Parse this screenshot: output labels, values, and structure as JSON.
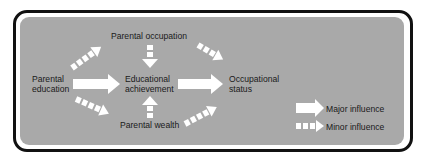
{
  "nodes": {
    "parental_education": {
      "line1": "Parental",
      "line2": "education"
    },
    "parental_occupation": {
      "label": "Parental occupation"
    },
    "educational_achievement": {
      "line1": "Educational",
      "line2": "achievement"
    },
    "parental_wealth": {
      "label": "Parental wealth"
    },
    "occupational_status": {
      "line1": "Occupational",
      "line2": "status"
    }
  },
  "edges": [
    {
      "from": "Parental education",
      "to": "Educational achievement",
      "type": "major"
    },
    {
      "from": "Educational achievement",
      "to": "Occupational status",
      "type": "major"
    },
    {
      "from": "Parental education",
      "to": "Parental occupation",
      "type": "minor"
    },
    {
      "from": "Parental education",
      "to": "Parental wealth",
      "type": "minor"
    },
    {
      "from": "Parental occupation",
      "to": "Educational achievement",
      "type": "minor"
    },
    {
      "from": "Parental wealth",
      "to": "Educational achievement",
      "type": "minor"
    },
    {
      "from": "Parental occupation",
      "to": "Occupational status",
      "type": "minor"
    },
    {
      "from": "Parental wealth",
      "to": "Occupational status",
      "type": "minor"
    }
  ],
  "legend": {
    "major_label": "Major influence",
    "minor_label": "Minor influence"
  },
  "colors": {
    "panel": "#a9a9a9",
    "border": "#111111",
    "arrow": "#ffffff",
    "text": "#1a1a1a"
  }
}
